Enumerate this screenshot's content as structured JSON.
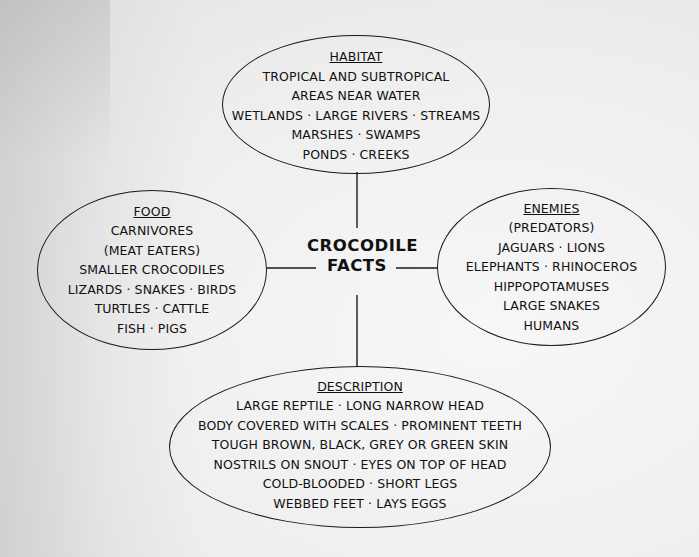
{
  "diagram": {
    "center": {
      "line1": "CROCODILE",
      "line2": "FACTS"
    },
    "habitat": {
      "title": "HABITAT",
      "lines": [
        "TROPICAL AND SUBTROPICAL",
        "AREAS NEAR WATER",
        "WETLANDS · LARGE RIVERS ·  STREAMS",
        "MARSHES · SWAMPS",
        "PONDS · CREEKS"
      ]
    },
    "food": {
      "title": "FOOD",
      "lines": [
        "CARNIVORES",
        "(MEAT EATERS)",
        "SMALLER CROCODILES",
        "LIZARDS · SNAKES · BIRDS",
        "TURTLES · CATTLE",
        "FISH · PIGS"
      ]
    },
    "enemies": {
      "title": "ENEMIES",
      "lines": [
        "(PREDATORS)",
        "JAGUARS · LIONS",
        "ELEPHANTS · RHINOCEROS",
        "HIPPOPOTAMUSES",
        "LARGE SNAKES",
        "HUMANS"
      ]
    },
    "description": {
      "title": "DESCRIPTION",
      "lines": [
        "LARGE REPTILE · LONG NARROW HEAD",
        "BODY COVERED WITH SCALES · PROMINENT TEETH",
        "TOUGH BROWN, BLACK, GREY OR GREEN SKIN",
        "NOSTRILS ON SNOUT · EYES ON TOP OF HEAD",
        "COLD-BLOODED · SHORT LEGS",
        "WEBBED FEET · LAYS EGGS"
      ]
    }
  },
  "colors": {
    "ink": "#1a1a1a",
    "paper": "#efefef"
  }
}
